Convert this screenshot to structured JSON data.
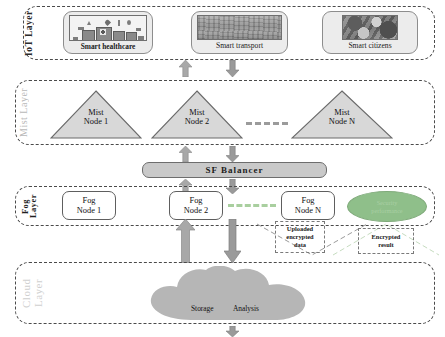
{
  "layers": [
    {
      "id": "iot",
      "label": "IoT Layer",
      "label_color": "#2b2b2b"
    },
    {
      "id": "mist",
      "label": "Mist Layer",
      "label_color": "#b9b9b9"
    },
    {
      "id": "fog",
      "label": "Fog Layer",
      "label_color": "#1f1f1f"
    },
    {
      "id": "cloud",
      "label": "Cloud Layer",
      "label_color": "#cfcfcf"
    }
  ],
  "iot_layer": {
    "cards": [
      {
        "caption": "Smart healthcare",
        "thumb": "healthcare-pictogram",
        "bold": true
      },
      {
        "caption": "Smart transport",
        "thumb": "transport-photo",
        "bold": false
      },
      {
        "caption": "Smart citizens",
        "thumb": "citizens-photo",
        "bold": false
      }
    ]
  },
  "mist_layer": {
    "nodes": [
      {
        "line1": "Mist",
        "line2": "Node 1"
      },
      {
        "line1": "Mist",
        "line2": "Node 2"
      },
      {
        "line1": "Mist",
        "line2": "Node N"
      }
    ],
    "ellipsis": "- - - -",
    "fill_color": "#d8d8d8",
    "stroke_color": "#6a6a6a"
  },
  "balancer": {
    "label": "SF  Balancer",
    "fill_color": "#c9c9c9"
  },
  "fog_layer": {
    "nodes": [
      {
        "line1": "Fog",
        "line2": "Node 1"
      },
      {
        "line1": "Fog",
        "line2": "Node 2"
      },
      {
        "line1": "Fog",
        "line2": "Node N"
      }
    ],
    "ellipsis": "- - - -",
    "security": {
      "line1": "Security",
      "line2": "performance",
      "fill_color": "#8fbf8a"
    }
  },
  "callouts": [
    {
      "id": "uploaded",
      "line1": "Uploaded",
      "line2": "encrypted",
      "line3": "data",
      "direction": "down"
    },
    {
      "id": "result",
      "line1": "Encrypted",
      "line2": "result",
      "line3": "",
      "direction": "up"
    }
  ],
  "cloud_layer": {
    "labels": [
      "Storage",
      "Analysis"
    ],
    "fill_color": "#b6b6b6"
  },
  "arrows": {
    "up_color": "#a8a8a8",
    "down_color": "#9a9a9a"
  }
}
